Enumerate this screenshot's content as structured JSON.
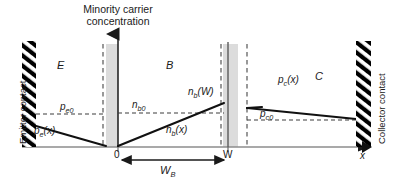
{
  "figure": {
    "title_line1": "Minority carrier",
    "title_line2": "concentration",
    "colors": {
      "line": "#1a1a1a",
      "depletion_fill": "#d9d9d9",
      "dashed": "#4d4d4d",
      "axis": "#808080",
      "hatch": "#000000",
      "background": "#ffffff"
    }
  },
  "contacts": {
    "left_label": "Emitter contact",
    "right_label": "Collector contact"
  },
  "regions": [
    {
      "id": "emitter",
      "label": "E"
    },
    {
      "id": "base",
      "label": "B"
    },
    {
      "id": "collector",
      "label": "C"
    }
  ],
  "curves": {
    "emitter_equilibrium": {
      "label": "p",
      "sub": "e0"
    },
    "emitter_profile": {
      "label": "p",
      "sub": "e",
      "arg": "(x)"
    },
    "base_equilibrium": {
      "label": "n",
      "sub": "b0"
    },
    "base_at_w": {
      "label": "n",
      "sub": "b",
      "arg": "(W)"
    },
    "base_profile": {
      "label": "n",
      "sub": "b",
      "arg": "(x)"
    },
    "collector_equilibrium": {
      "label": "p",
      "sub": "c0"
    },
    "collector_profile": {
      "label": "p",
      "sub": "c",
      "arg": "(x)"
    }
  },
  "axis": {
    "origin_tick": "0",
    "w_tick": "W",
    "x_label": "x",
    "dimension": {
      "label": "W",
      "sub": "B"
    }
  }
}
